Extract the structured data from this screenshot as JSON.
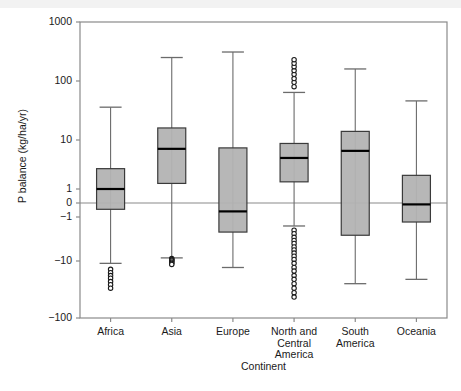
{
  "chart_data": {
    "type": "box",
    "title": "",
    "xlabel": "Continent",
    "ylabel": "P balance (kg/ha/yr)",
    "yscale": "symlog",
    "ylim": [
      -100,
      1000
    ],
    "ytick_labels": [
      "1000",
      "100",
      "10",
      "1",
      "0",
      "−1",
      "−10",
      "−100"
    ],
    "ytick_values": [
      1000,
      100,
      10,
      1,
      0,
      -1,
      -10,
      -100
    ],
    "grid": false,
    "legend": null,
    "zero_reference_line": 0,
    "categories": [
      "Africa",
      "Asia",
      "Europe",
      "North and Central America",
      "South America",
      "Oceania"
    ],
    "category_label_lines": [
      [
        "Africa"
      ],
      [
        "Asia"
      ],
      [
        "Europe"
      ],
      [
        "North and",
        "Central",
        "America"
      ],
      [
        "South",
        "America"
      ],
      [
        "Oceania"
      ]
    ],
    "boxes": [
      {
        "name": "Africa",
        "whisker_high": 36,
        "q3": 2.6,
        "median": 1.0,
        "q1": -0.45,
        "whisker_low": -11,
        "outliers_high": [],
        "outliers_low": [
          -14,
          -16,
          -18,
          -20,
          -23,
          -26,
          -30
        ]
      },
      {
        "name": "Asia",
        "whisker_high": 250,
        "q3": 16,
        "median": 6.6,
        "q1": 1.3,
        "whisker_low": -8.5,
        "outliers_high": [],
        "outliers_low": [
          -8.8,
          -9.2,
          -9.6,
          -10,
          -10.5,
          -11,
          -11.5
        ]
      },
      {
        "name": "Europe",
        "whisker_high": 310,
        "q3": 6.9,
        "median": -0.6,
        "q1": -2.2,
        "whisker_low": -13,
        "outliers_high": [],
        "outliers_low": []
      },
      {
        "name": "North and Central America",
        "whisker_high": 64,
        "q3": 8.5,
        "median": 4.3,
        "q1": 1.4,
        "whisker_low": -1.6,
        "outliers_high": [
          80,
          95,
          110,
          130,
          150,
          175,
          200,
          230
        ],
        "outliers_low": [
          -2.0,
          -2.4,
          -2.9,
          -3.4,
          -4.0,
          -4.8,
          -5.6,
          -6.6,
          -7.8,
          -9.2,
          -11,
          -13,
          -15,
          -18,
          -21,
          -25,
          -30,
          -36,
          -43
        ]
      },
      {
        "name": "South America",
        "whisker_high": 160,
        "q3": 14,
        "median": 6.0,
        "q1": -2.6,
        "whisker_low": -25,
        "outliers_high": [],
        "outliers_low": []
      },
      {
        "name": "Oceania",
        "whisker_high": 46,
        "q3": 1.9,
        "median": -0.1,
        "q1": -1.3,
        "whisker_low": -21,
        "outliers_high": [],
        "outliers_low": []
      }
    ],
    "colors": {
      "box_fill": "#b3b3b3",
      "box_edge": "#3a3a3a",
      "median": "#000000",
      "whisker": "#6b6b6b",
      "axis": "#8a8a8a",
      "zero_line": "#8a8a8a",
      "outlier_edge": "#1a1a1a"
    }
  }
}
